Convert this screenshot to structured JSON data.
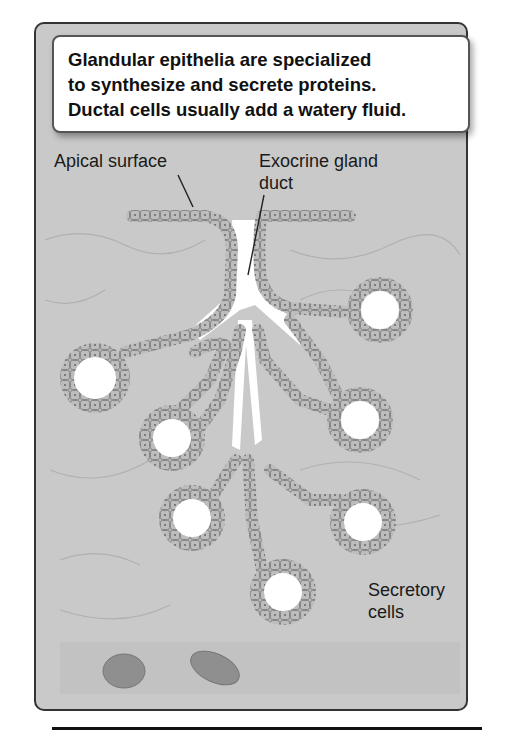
{
  "callout": {
    "lines": [
      "Glandular epithelia are specialized",
      "to synthesize and secrete proteins.",
      "Ductal cells usually add a watery fluid."
    ]
  },
  "labels": {
    "apical_surface": "Apical surface",
    "exocrine_line1": "Exocrine gland",
    "exocrine_line2": "duct",
    "secretory_line1": "Secretory",
    "secretory_line2": "cells"
  },
  "colors": {
    "background": "#c9c9c9",
    "cell_fill": "#b5b5b5",
    "cell_stroke": "#777777",
    "lumen": "#ffffff",
    "frame_border": "#333333",
    "rbc": "#8c8c8c"
  }
}
